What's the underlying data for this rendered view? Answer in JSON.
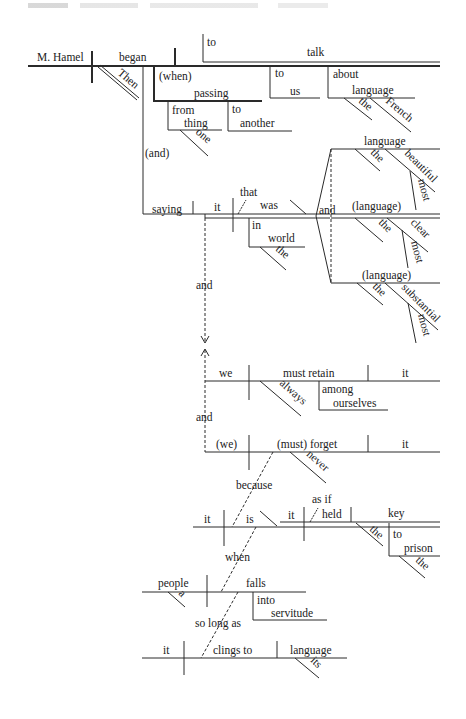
{
  "header": {
    "text_visible": false
  },
  "diagram": {
    "type": "sentence-diagram",
    "main": {
      "subject": "M. Hamel",
      "verb": "began",
      "adverb": "Then",
      "infinitive": {
        "to": "to",
        "verb": "talk",
        "phrase1": {
          "prep": "to",
          "obj": "us"
        },
        "phrase2": {
          "prep": "about",
          "obj": "language",
          "mods": [
            "the",
            "French"
          ]
        }
      },
      "when_clause": {
        "conj": "(when)",
        "verb": "passing",
        "phrase1": {
          "prep": "from",
          "obj": "thing",
          "mod": "one"
        },
        "phrase2": {
          "prep": "to",
          "obj": "another"
        }
      },
      "and1": "(and)",
      "saying": {
        "verb": "saying",
        "clause": {
          "subject": "it",
          "that": "that",
          "verb": "was",
          "phrase": {
            "prep": "in",
            "obj": "world",
            "mod": "the"
          },
          "compound_and": "and",
          "complements": [
            {
              "word": "language",
              "mods": [
                "the",
                "beautiful"
              ],
              "sub": "most"
            },
            {
              "word": "(language)",
              "mods": [
                "the",
                "clear"
              ],
              "sub": "most"
            },
            {
              "word": "(language)",
              "mods": [
                "the",
                "substantial"
              ],
              "sub": "most"
            }
          ]
        }
      }
    },
    "connector_and_1": "and",
    "clause2": {
      "subject": "we",
      "verb": "must retain",
      "object": "it",
      "adverb": "always",
      "phrase": {
        "prep": "among",
        "obj": "ourselves"
      }
    },
    "connector_and_2": "and",
    "clause3": {
      "subject": "(we)",
      "verb": "(must) forget",
      "object": "it",
      "adverb": "never"
    },
    "because": "because",
    "clause4": {
      "subject": "it",
      "verb": "is",
      "asif": "as if",
      "sub": {
        "subject": "it",
        "verb": "held",
        "object": "key",
        "mod": "the",
        "phrase": {
          "prep": "to",
          "obj": "prison",
          "mod": "the"
        }
      }
    },
    "when": "when",
    "clause5": {
      "subject": "people",
      "mod": "a",
      "verb": "falls",
      "phrase": {
        "prep": "into",
        "obj": "servitude"
      }
    },
    "so_long_as": "so long as",
    "clause6": {
      "subject": "it",
      "verb": "clings to",
      "object": "language",
      "mod": "its"
    }
  }
}
